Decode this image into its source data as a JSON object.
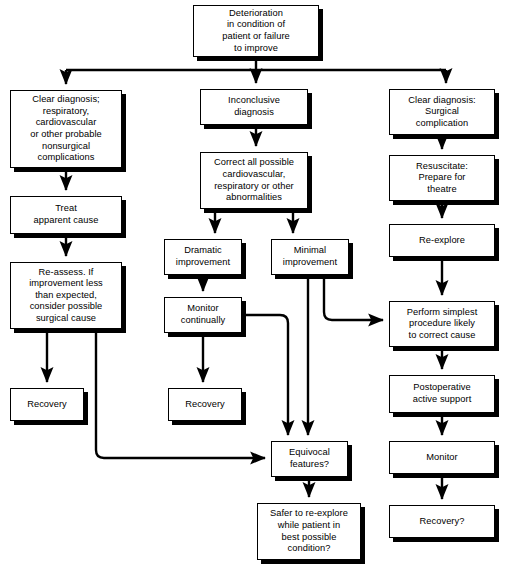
{
  "diagram": {
    "colors": {
      "background": "#ffffff",
      "box_fill": "#ffffff",
      "box_stroke": "#000000",
      "shadow": "#000000",
      "edge": "#000000",
      "text": "#000000"
    },
    "nodes": [
      {
        "id": "deterioration",
        "label": "Deterioration\nin condition of\npatient or failure\nto improve",
        "x": 193,
        "y": 5,
        "w": 126,
        "h": 52
      },
      {
        "id": "clear-diagnosis-nonsurgical",
        "label": "Clear diagnosis;\nrespiratory,\ncardiovascular\nor other probable\nnonsurgical\ncomplications",
        "x": 10,
        "y": 90,
        "w": 112,
        "h": 78
      },
      {
        "id": "inconclusive-diagnosis",
        "label": "Inconclusive\ndiagnosis",
        "x": 200,
        "y": 89,
        "w": 108,
        "h": 36
      },
      {
        "id": "clear-diagnosis-surgical",
        "label": "Clear diagnosis:\nSurgical\ncomplication",
        "x": 389,
        "y": 89,
        "w": 106,
        "h": 46
      },
      {
        "id": "treat-apparent-cause",
        "label": "Treat\napparent cause",
        "x": 10,
        "y": 196,
        "w": 112,
        "h": 38
      },
      {
        "id": "correct-all-possible",
        "label": "Correct all possible\ncardiovascular,\nrespiratory or other\nabnormalities",
        "x": 200,
        "y": 152,
        "w": 108,
        "h": 57
      },
      {
        "id": "resuscitate-prepare",
        "label": "Resuscitate:\nPrepare for\ntheatre",
        "x": 389,
        "y": 155,
        "w": 106,
        "h": 46
      },
      {
        "id": "re-assess",
        "label": "Re-assess. If\nimprovement less\nthan expected,\nconsider possible\nsurgical cause",
        "x": 10,
        "y": 262,
        "w": 112,
        "h": 67
      },
      {
        "id": "dramatic-improvement",
        "label": "Dramatic\nimprovement",
        "x": 164,
        "y": 239,
        "w": 78,
        "h": 36
      },
      {
        "id": "minimal-improvement",
        "label": "Minimal\nimprovement",
        "x": 271,
        "y": 239,
        "w": 78,
        "h": 36
      },
      {
        "id": "re-explore",
        "label": "Re-explore",
        "x": 389,
        "y": 224,
        "w": 106,
        "h": 33
      },
      {
        "id": "monitor-continually",
        "label": "Monitor\ncontinually",
        "x": 164,
        "y": 297,
        "w": 78,
        "h": 36
      },
      {
        "id": "perform-simplest-procedure",
        "label": "Perform simplest\nprocedure likely\nto correct cause",
        "x": 389,
        "y": 301,
        "w": 106,
        "h": 46
      },
      {
        "id": "recovery-left",
        "label": "Recovery",
        "x": 10,
        "y": 388,
        "w": 74,
        "h": 33
      },
      {
        "id": "recovery-center",
        "label": "Recovery",
        "x": 168,
        "y": 388,
        "w": 74,
        "h": 33
      },
      {
        "id": "postoperative-active-support",
        "label": "Postoperative\nactive support",
        "x": 389,
        "y": 375,
        "w": 106,
        "h": 38
      },
      {
        "id": "equivocal-features",
        "label": "Equivocal\nfeatures?",
        "x": 271,
        "y": 441,
        "w": 77,
        "h": 36
      },
      {
        "id": "monitor-right",
        "label": "Monitor",
        "x": 389,
        "y": 441,
        "w": 106,
        "h": 33
      },
      {
        "id": "safer-to-re-explore",
        "label": "Safer to re-explore\nwhile patient in\nbest possible\ncondition?",
        "x": 257,
        "y": 503,
        "w": 104,
        "h": 57
      },
      {
        "id": "recovery-right",
        "label": "Recovery?",
        "x": 389,
        "y": 505,
        "w": 106,
        "h": 33
      }
    ],
    "edges": [
      {
        "id": "deterioration-to-left",
        "from": "deterioration",
        "to": "clear-diagnosis-nonsurgical",
        "kind": "bus-branch"
      },
      {
        "id": "deterioration-to-center",
        "from": "deterioration",
        "to": "inconclusive-diagnosis",
        "kind": "bus-branch"
      },
      {
        "id": "deterioration-to-right",
        "from": "deterioration",
        "to": "clear-diagnosis-surgical",
        "kind": "bus-branch"
      },
      {
        "id": "left-1-to-treat",
        "from": "clear-diagnosis-nonsurgical",
        "to": "treat-apparent-cause",
        "kind": "straight"
      },
      {
        "id": "treat-to-reassess",
        "from": "treat-apparent-cause",
        "to": "re-assess",
        "kind": "straight"
      },
      {
        "id": "reassess-to-recovery",
        "from": "re-assess",
        "to": "recovery-left",
        "kind": "straight"
      },
      {
        "id": "reassess-to-equivocal",
        "from": "re-assess",
        "to": "equivocal-features",
        "kind": "elbow"
      },
      {
        "id": "inconclusive-to-correct",
        "from": "inconclusive-diagnosis",
        "to": "correct-all-possible",
        "kind": "straight"
      },
      {
        "id": "correct-to-dramatic",
        "from": "correct-all-possible",
        "to": "dramatic-improvement",
        "kind": "straight"
      },
      {
        "id": "correct-to-minimal",
        "from": "correct-all-possible",
        "to": "minimal-improvement",
        "kind": "straight"
      },
      {
        "id": "dramatic-to-monitor",
        "from": "dramatic-improvement",
        "to": "monitor-continually",
        "kind": "straight"
      },
      {
        "id": "monitor-to-recovery",
        "from": "monitor-continually",
        "to": "recovery-center",
        "kind": "straight"
      },
      {
        "id": "monitor-to-equivocal",
        "from": "monitor-continually",
        "to": "equivocal-features",
        "kind": "elbow"
      },
      {
        "id": "minimal-to-equivocal",
        "from": "minimal-improvement",
        "to": "equivocal-features",
        "kind": "straight"
      },
      {
        "id": "minimal-to-perform",
        "from": "minimal-improvement",
        "to": "perform-simplest-procedure",
        "kind": "elbow"
      },
      {
        "id": "surgical-to-resuscitate",
        "from": "clear-diagnosis-surgical",
        "to": "resuscitate-prepare",
        "kind": "straight"
      },
      {
        "id": "resuscitate-to-reexplore",
        "from": "resuscitate-prepare",
        "to": "re-explore",
        "kind": "straight"
      },
      {
        "id": "reexplore-to-perform",
        "from": "re-explore",
        "to": "perform-simplest-procedure",
        "kind": "straight"
      },
      {
        "id": "perform-to-postop",
        "from": "perform-simplest-procedure",
        "to": "postoperative-active-support",
        "kind": "straight"
      },
      {
        "id": "postop-to-monitor",
        "from": "postoperative-active-support",
        "to": "monitor-right",
        "kind": "straight"
      },
      {
        "id": "monitor-to-recovery-right",
        "from": "monitor-right",
        "to": "recovery-right",
        "kind": "straight"
      },
      {
        "id": "equivocal-to-safer",
        "from": "equivocal-features",
        "to": "safer-to-re-explore",
        "kind": "straight"
      }
    ]
  }
}
